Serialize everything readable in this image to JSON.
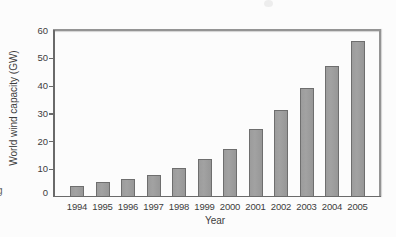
{
  "page": {
    "background": "#fcfcfc",
    "left_edge_fragment": "g"
  },
  "chart_data": {
    "type": "bar",
    "title": "",
    "xlabel": "Year",
    "ylabel": "World wind capacity (GW)",
    "categories": [
      "1994",
      "1995",
      "1996",
      "1997",
      "1998",
      "1999",
      "2000",
      "2001",
      "2002",
      "2003",
      "2004",
      "2005"
    ],
    "values": [
      3.5,
      5,
      6,
      7.5,
      10,
      13.5,
      17,
      24,
      31,
      39,
      47,
      56
    ],
    "ylim": [
      0,
      60
    ],
    "yticks": [
      0,
      10,
      20,
      30,
      40,
      50,
      60
    ],
    "grid": false,
    "legend": false,
    "frame": "box",
    "bar_fill_color": "#a2a2a2",
    "bar_border_color": "#6e6e6e",
    "axis_line_color": "#6a6a6a",
    "frame_line_color": "#949494",
    "text_color": "#3d3d3d"
  }
}
